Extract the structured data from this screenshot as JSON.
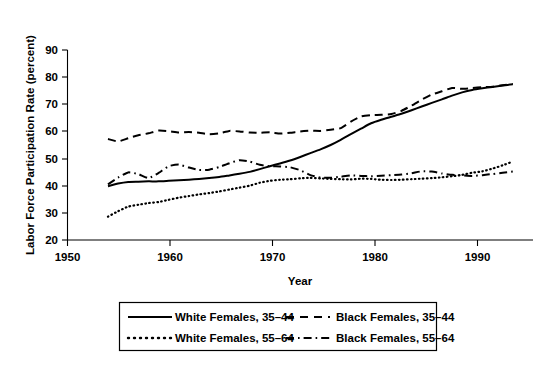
{
  "chart_data": {
    "type": "line",
    "title": "",
    "xlabel": "Year",
    "ylabel": "Labor Force Participation Rate (percent)",
    "xlim": [
      1950,
      1996
    ],
    "ylim": [
      20,
      90
    ],
    "xticks": [
      1950,
      1960,
      1970,
      1980,
      1990
    ],
    "yticks": [
      20,
      30,
      40,
      50,
      60,
      70,
      80,
      90
    ],
    "grid": false,
    "legend_position": "below-center",
    "x": [
      1954,
      1955,
      1956,
      1957,
      1958,
      1959,
      1960,
      1961,
      1962,
      1963,
      1964,
      1965,
      1966,
      1967,
      1968,
      1969,
      1970,
      1971,
      1972,
      1973,
      1974,
      1975,
      1976,
      1977,
      1978,
      1979,
      1980,
      1981,
      1982,
      1983,
      1984,
      1985,
      1986,
      1987,
      1988,
      1989,
      1990,
      1991,
      1992,
      1993,
      1994
    ],
    "series": [
      {
        "name": "White Females, 35-44",
        "style": "solid",
        "values": [
          39.8,
          40.8,
          41.4,
          41.5,
          41.6,
          41.6,
          41.8,
          42.0,
          42.2,
          42.5,
          42.8,
          43.2,
          43.8,
          44.4,
          45.1,
          46.1,
          47.2,
          48.2,
          49.3,
          50.6,
          52.0,
          53.4,
          55.0,
          56.9,
          59.0,
          61.0,
          63.0,
          64.3,
          65.4,
          66.5,
          67.8,
          69.2,
          70.5,
          71.8,
          73.2,
          74.4,
          75.3,
          75.9,
          76.4,
          76.9,
          77.4
        ]
      },
      {
        "name": "Black Females, 35-44",
        "style": "dashed",
        "values": [
          57.2,
          56.3,
          57.5,
          58.6,
          59.3,
          60.3,
          60.1,
          59.6,
          59.8,
          59.5,
          59.0,
          59.3,
          60.2,
          60.0,
          59.6,
          59.5,
          59.7,
          59.2,
          59.5,
          60.0,
          60.3,
          60.2,
          60.6,
          61.2,
          63.6,
          65.5,
          66.0,
          66.1,
          66.4,
          67.6,
          69.5,
          71.7,
          73.6,
          74.8,
          76.0,
          75.7,
          76.0,
          76.3,
          76.5,
          77.0,
          77.5
        ]
      },
      {
        "name": "White Females, 55-64",
        "style": "dotted",
        "values": [
          28.6,
          30.6,
          32.3,
          33.0,
          33.6,
          34.0,
          34.8,
          35.6,
          36.2,
          36.8,
          37.3,
          37.9,
          38.6,
          39.3,
          40.0,
          41.1,
          41.8,
          42.2,
          42.4,
          42.7,
          42.9,
          42.7,
          42.5,
          42.4,
          42.3,
          42.6,
          42.5,
          42.2,
          42.1,
          42.2,
          42.4,
          42.6,
          42.8,
          43.1,
          43.5,
          44.0,
          44.8,
          45.3,
          46.3,
          47.5,
          48.9
        ]
      },
      {
        "name": "Black Females, 55-64",
        "style": "dash-dot",
        "values": [
          40.5,
          43.0,
          44.9,
          44.3,
          42.8,
          44.7,
          47.2,
          47.8,
          46.7,
          45.8,
          45.9,
          46.9,
          48.3,
          49.4,
          48.9,
          47.7,
          47.2,
          47.1,
          46.8,
          45.7,
          43.9,
          43.0,
          42.9,
          43.3,
          43.8,
          43.6,
          43.5,
          43.7,
          43.9,
          44.1,
          44.6,
          45.3,
          45.2,
          44.5,
          44.0,
          43.8,
          43.6,
          43.9,
          44.3,
          44.8,
          45.2
        ]
      }
    ]
  },
  "legend": {
    "entries": [
      {
        "label": "White Females, 35–44",
        "style": "solid"
      },
      {
        "label": "Black Females, 35–44",
        "style": "dashed"
      },
      {
        "label": "White Females, 55–64",
        "style": "dotted"
      },
      {
        "label": "Black Females, 55–64",
        "style": "dash-dot"
      }
    ]
  },
  "axes": {
    "y_title": "Labor Force Participation Rate (percent)",
    "x_title": "Year",
    "y_tick_labels": [
      "90",
      "80",
      "70",
      "60",
      "50",
      "40",
      "30",
      "20"
    ],
    "x_tick_labels": [
      "1950",
      "1960",
      "1970",
      "1980",
      "1990"
    ]
  }
}
